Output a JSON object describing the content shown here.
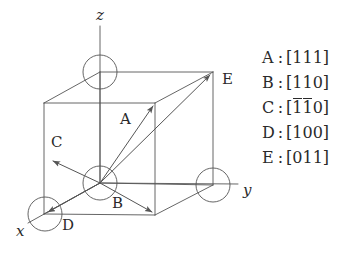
{
  "figure": {
    "axes": [
      {
        "name": "z-axis-label",
        "text": "z",
        "x": 96,
        "y": 8
      },
      {
        "name": "y-axis-label",
        "text": "y",
        "x": 243,
        "y": 183
      },
      {
        "name": "x-axis-label",
        "text": "x",
        "x": 16,
        "y": 224
      }
    ],
    "vector_labels": [
      {
        "name": "vector-label-a",
        "text": "A",
        "x": 120,
        "y": 112
      },
      {
        "name": "vector-label-b",
        "text": "B",
        "x": 112,
        "y": 196
      },
      {
        "name": "vector-label-c",
        "text": "C",
        "x": 51,
        "y": 135
      },
      {
        "name": "vector-label-d",
        "text": "D",
        "x": 62,
        "y": 218
      },
      {
        "name": "vector-label-e",
        "text": "E",
        "x": 222,
        "y": 72
      }
    ],
    "line_color": "#555555",
    "atom_fill": "#ffffff",
    "atom_stroke": "#555555"
  },
  "legend": {
    "rows": [
      {
        "key": "A",
        "colon": ":",
        "open": "[",
        "digits": [
          {
            "v": "1",
            "bar": false
          },
          {
            "v": "1",
            "bar": false
          },
          {
            "v": "1",
            "bar": false
          }
        ],
        "close": "]"
      },
      {
        "key": "B",
        "colon": ":",
        "open": "[",
        "digits": [
          {
            "v": "1",
            "bar": false
          },
          {
            "v": "1",
            "bar": false
          },
          {
            "v": "0",
            "bar": false
          }
        ],
        "close": "]"
      },
      {
        "key": "C",
        "colon": ":",
        "open": "[",
        "digits": [
          {
            "v": "1",
            "bar": true
          },
          {
            "v": "1",
            "bar": true
          },
          {
            "v": "0",
            "bar": false
          }
        ],
        "close": "]"
      },
      {
        "key": "D",
        "colon": ":",
        "open": "[",
        "digits": [
          {
            "v": "1",
            "bar": false
          },
          {
            "v": "0",
            "bar": false
          },
          {
            "v": "0",
            "bar": false
          }
        ],
        "close": "]"
      },
      {
        "key": "E",
        "colon": ":",
        "open": "[",
        "digits": [
          {
            "v": "0",
            "bar": false
          },
          {
            "v": "1",
            "bar": false
          },
          {
            "v": "1",
            "bar": false
          }
        ],
        "close": "]"
      }
    ]
  }
}
